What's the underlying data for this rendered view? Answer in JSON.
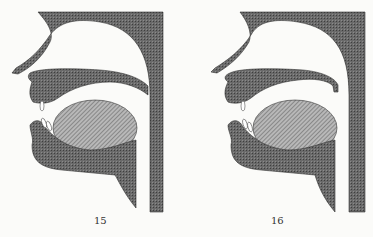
{
  "figures": [
    {
      "label": "15",
      "description": "Sagittal section of vocal tract, velum lowered"
    },
    {
      "label": "16",
      "description": "Sagittal section of vocal tract, velum raised"
    }
  ],
  "colors": {
    "tissue": "#5e5e5e",
    "tongue": "#a9a9a9",
    "background": "#fbfbf9",
    "teeth": "#ffffff"
  }
}
